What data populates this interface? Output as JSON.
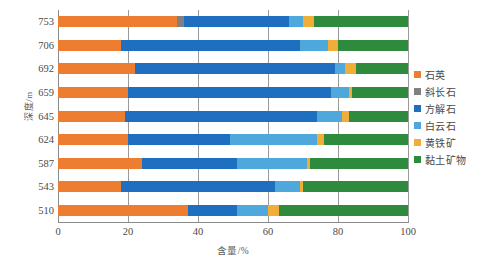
{
  "chart_data": {
    "type": "bar",
    "orientation": "horizontal",
    "stacked": true,
    "title": "",
    "xlabel": "含量/%",
    "ylabel": "深度/m",
    "xlim": [
      0,
      100
    ],
    "xticks": [
      0,
      20,
      40,
      60,
      80,
      100
    ],
    "xtick_labels": [
      "0",
      "20",
      "40",
      "60",
      "80",
      "100"
    ],
    "grid": true,
    "grid_axis": "x",
    "legend_position": "right",
    "categories": [
      "510",
      "543",
      "587",
      "624",
      "645",
      "659",
      "692",
      "706",
      "753"
    ],
    "category_order_top_to_bottom": [
      "753",
      "706",
      "692",
      "659",
      "645",
      "624",
      "587",
      "543",
      "510"
    ],
    "series": [
      {
        "name": "石英",
        "color": "#ED7D31",
        "values": [
          37.0,
          18.0,
          24.0,
          20.0,
          19.0,
          20.0,
          22.0,
          18.0,
          34.0
        ]
      },
      {
        "name": "斜长石",
        "color": "#808080",
        "values": [
          0.0,
          0.0,
          0.0,
          0.0,
          0.0,
          0.0,
          0.0,
          0.0,
          2.0
        ]
      },
      {
        "name": "方解石",
        "color": "#1F6FC0",
        "values": [
          14.0,
          44.0,
          27.0,
          29.0,
          55.0,
          58.0,
          57.0,
          51.0,
          30.0
        ]
      },
      {
        "name": "白云石",
        "color": "#4FA8DC",
        "values": [
          9.0,
          7.0,
          20.0,
          25.0,
          7.0,
          5.0,
          3.0,
          8.0,
          4.0
        ]
      },
      {
        "name": "黄铁矿",
        "color": "#F0AE38",
        "values": [
          3.0,
          1.0,
          1.0,
          2.0,
          2.0,
          1.0,
          3.0,
          3.0,
          3.0
        ]
      },
      {
        "name": "黏土矿物",
        "color": "#2E8B3D",
        "values": [
          37.0,
          30.0,
          28.0,
          24.0,
          17.0,
          16.0,
          15.0,
          20.0,
          27.0
        ]
      }
    ]
  },
  "legend": {
    "items": [
      {
        "label": "石英",
        "color": "#ED7D31"
      },
      {
        "label": "斜长石",
        "color": "#808080"
      },
      {
        "label": "方解石",
        "color": "#1F6FC0"
      },
      {
        "label": "白云石",
        "color": "#4FA8DC"
      },
      {
        "label": "黄铁矿",
        "color": "#F0AE38"
      },
      {
        "label": "黏土矿物",
        "color": "#2E8B3D"
      }
    ]
  },
  "axes": {
    "y_title": "深度/m",
    "x_title": "含量/%"
  }
}
